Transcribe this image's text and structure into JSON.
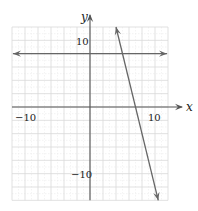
{
  "chart_data": {
    "type": "line",
    "title": "",
    "xlabel": "x",
    "ylabel": "y",
    "xlim": [
      -12,
      12
    ],
    "ylim": [
      -14,
      12
    ],
    "grid": true,
    "grid_step": 2,
    "x_tick_labels": [
      {
        "value": -10,
        "label": "−10"
      },
      {
        "value": 10,
        "label": "10"
      }
    ],
    "y_tick_labels": [
      {
        "value": 10,
        "label": "10"
      },
      {
        "value": -10,
        "label": "−10"
      }
    ],
    "series": [
      {
        "name": "horizontal line",
        "equation": "y = 8",
        "points": [
          [
            -12,
            8
          ],
          [
            12,
            8
          ]
        ],
        "arrows": "both"
      },
      {
        "name": "steep line",
        "equation": "y = -4x + 28",
        "points": [
          [
            4,
            12
          ],
          [
            10.5,
            -14
          ]
        ],
        "arrows": "both"
      }
    ],
    "legend": null
  },
  "colors": {
    "grid": "#d9d9d9",
    "axis": "#555555",
    "line": "#666666"
  }
}
